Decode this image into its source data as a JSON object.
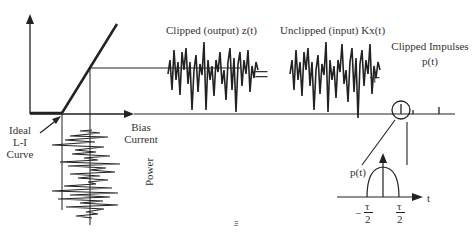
{
  "labels": {
    "clipped_output": "Clipped (output)  z(t)",
    "unclipped_input": "Unclipped (input)  Kx(t)",
    "clipped_impulses_line1": "Clipped Impulses",
    "clipped_impulses_line2": "p(t)",
    "ideal_line1": "Ideal",
    "ideal_line2": "L-I",
    "ideal_line3": "Curve",
    "bias_line1": "Bias",
    "bias_line2": "Current",
    "power": "Power",
    "equals": "=",
    "plus": "+",
    "pt_detail": "p(t)",
    "tau_neg": "−",
    "tau": "τ",
    "two": "2",
    "t_axis": "t",
    "bottom_mark": "ht"
  },
  "colors": {
    "ink": "#222222",
    "background": "#ffffff"
  }
}
